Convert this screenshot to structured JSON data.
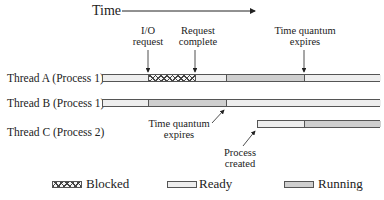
{
  "header": {
    "time_label": "Time"
  },
  "callouts": {
    "io_request": [
      "I/O",
      "request"
    ],
    "request_complete": [
      "Request",
      "complete"
    ],
    "time_quantum_top": [
      "Time quantum",
      "expires"
    ],
    "time_quantum_bottom": [
      "Time quantum",
      "expires"
    ],
    "process_created": [
      "Process",
      "created"
    ]
  },
  "threads": [
    {
      "label": "Thread A (Process 1)",
      "segments": [
        {
          "state": "ready",
          "start": 102,
          "end": 148
        },
        {
          "state": "blocked",
          "start": 148,
          "end": 195
        },
        {
          "state": "ready",
          "start": 195,
          "end": 226
        },
        {
          "state": "running",
          "start": 226,
          "end": 304
        },
        {
          "state": "ready",
          "start": 304,
          "end": 380
        }
      ]
    },
    {
      "label": "Thread B (Process 1)",
      "segments": [
        {
          "state": "ready",
          "start": 102,
          "end": 148
        },
        {
          "state": "running",
          "start": 148,
          "end": 226
        },
        {
          "state": "ready",
          "start": 226,
          "end": 380
        }
      ]
    },
    {
      "label": "Thread C (Process 2)",
      "segments": [
        {
          "state": "ready",
          "start": 257,
          "end": 304
        },
        {
          "state": "running",
          "start": 304,
          "end": 380
        }
      ]
    }
  ],
  "legend": {
    "blocked": "Blocked",
    "ready": "Ready",
    "running": "Running"
  },
  "colors": {
    "ready": "#eeeeee",
    "running": "#cfcfcf",
    "border": "#555555"
  }
}
